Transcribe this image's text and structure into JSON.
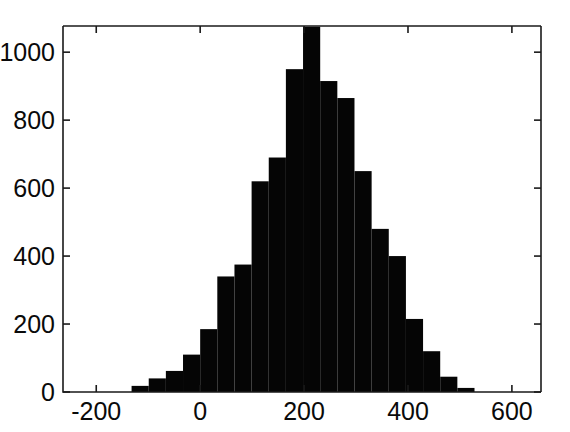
{
  "chart_data": {
    "type": "bar",
    "subtype": "histogram",
    "title": "",
    "subtitle": "",
    "xlabel": "",
    "ylabel": "",
    "xlim": [
      -264,
      656
    ],
    "ylim": [
      0,
      1077
    ],
    "grid": false,
    "legend": null,
    "annotations": [],
    "bar_color": "#050505",
    "axis_color": "#1a1a1a",
    "background_color": "#ffffff",
    "x_ticks": [
      -200,
      0,
      200,
      400,
      600
    ],
    "x_tick_labels": [
      "-200",
      "0",
      "200",
      "400",
      "600"
    ],
    "y_ticks": [
      0,
      200,
      400,
      600,
      800,
      1000
    ],
    "y_tick_labels": [
      "0",
      "200",
      "400",
      "600",
      "800",
      "1000"
    ],
    "bin_width": 33,
    "bin_edges": [
      -132,
      -99,
      -66,
      -33,
      0,
      33,
      66,
      99,
      132,
      165,
      198,
      231,
      264,
      297,
      330,
      363,
      396,
      429,
      462,
      495,
      528
    ],
    "bin_centers": [
      -115,
      -82,
      -49,
      -16,
      17,
      50,
      83,
      116,
      149,
      182,
      215,
      248,
      281,
      314,
      347,
      380,
      413,
      446,
      479,
      512
    ],
    "values": [
      18,
      40,
      62,
      110,
      185,
      340,
      375,
      620,
      690,
      950,
      1075,
      915,
      865,
      650,
      480,
      400,
      215,
      120,
      45,
      12
    ],
    "peak_bin_center": 215,
    "peak_value": 1075,
    "notes_clipped_above_axis": true
  }
}
